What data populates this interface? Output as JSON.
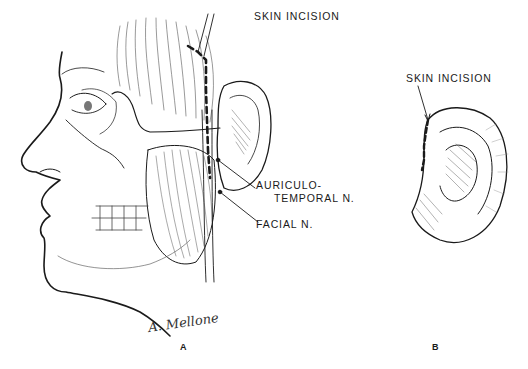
{
  "figure": {
    "panels": [
      {
        "id": "A",
        "letter": "A",
        "labels": {
          "skin_incision": "SKIN  INCISION",
          "auriculotemporal_line1": "AURICULO-",
          "auriculotemporal_line2": "TEMPORAL  N.",
          "facial_nerve": "FACIAL  N."
        },
        "signature": "A. Mellone"
      },
      {
        "id": "B",
        "letter": "B",
        "labels": {
          "skin_incision": "SKIN  INCISION"
        }
      }
    ],
    "colors": {
      "ink": "#1a1a1a",
      "background": "#ffffff",
      "hatch": "#6a6a6a"
    }
  }
}
